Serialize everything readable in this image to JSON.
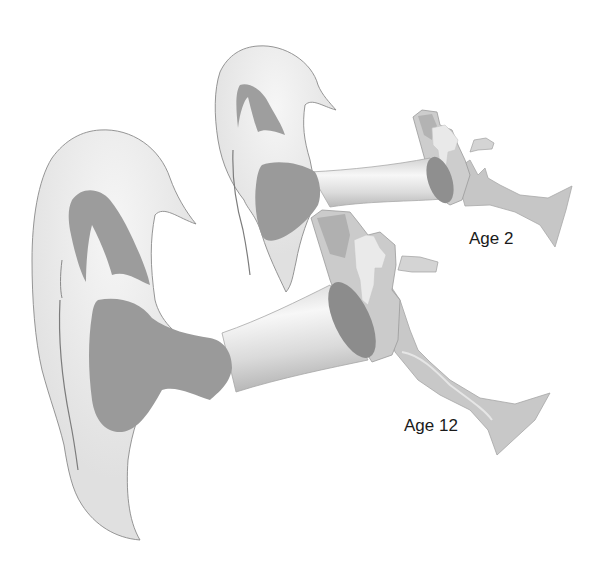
{
  "figure": {
    "type": "anatomical-illustration",
    "labels": {
      "young": "Age 2",
      "older": "Age 12"
    },
    "colors": {
      "background": "#ffffff",
      "pinna_light": "#e3e3e3",
      "pinna_highlight": "#f3f3f3",
      "concha_dark": "#9a9a9a",
      "outline": "#8a8a8a",
      "canal_light": "#f0f0f0",
      "canal_shade": "#bdbdbd",
      "eardrum": "#8e8e8e",
      "middle_ear": "#c4c4c4",
      "ossicles": "#e8e8e8",
      "eustachian_tube": "#c9c9c9",
      "label_text": "#1a1a1a"
    }
  }
}
